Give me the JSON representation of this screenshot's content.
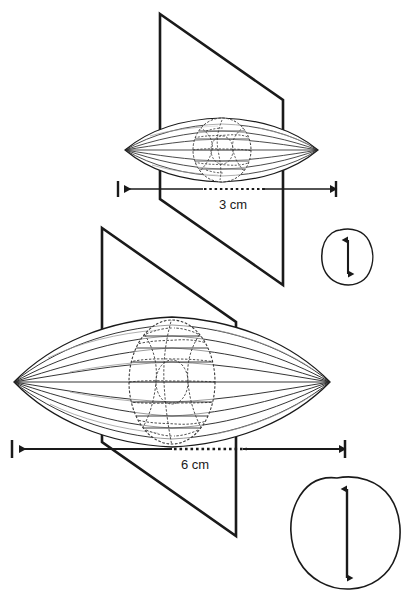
{
  "figure": {
    "background_color": "#ffffff",
    "ink_color": "#1a1a1a",
    "detail_color": "#4a4a4a",
    "width": 405,
    "height": 611
  },
  "specimens": [
    {
      "id": "small-spindle",
      "label": "3 cm",
      "dimension_value": 3,
      "dimension_unit": "cm",
      "rib_count": 7,
      "has_central_cell_mosaic": true,
      "plane_orientation": "vertical-perspective-parallelogram"
    },
    {
      "id": "large-spindle",
      "label": "6 cm",
      "dimension_value": 6,
      "dimension_unit": "cm",
      "rib_count": 9,
      "has_central_cell_mosaic": true,
      "plane_orientation": "vertical-perspective-parallelogram"
    }
  ],
  "dimension_lines": [
    {
      "id": "upper-dimension",
      "label": "3 cm",
      "endcap_style": "vertical-tick",
      "arrow_style": "double-headed-outward",
      "center_fill": "dotted"
    },
    {
      "id": "lower-dimension",
      "label": "6 cm",
      "endcap_style": "vertical-tick",
      "arrow_style": "double-headed-outward",
      "center_fill": "dotted"
    }
  ],
  "insets": [
    {
      "id": "small-cross-section",
      "shape": "irregular-rounded-blob",
      "arrow": "double-headed-vertical",
      "relative_size": "small",
      "corresponds_to": "small-spindle"
    },
    {
      "id": "large-cross-section",
      "shape": "irregular-rounded-blob",
      "arrow": "double-headed-vertical",
      "relative_size": "large",
      "corresponds_to": "large-spindle"
    }
  ],
  "labels": {
    "upper_measurement": "3 cm",
    "lower_measurement": "6 cm"
  }
}
